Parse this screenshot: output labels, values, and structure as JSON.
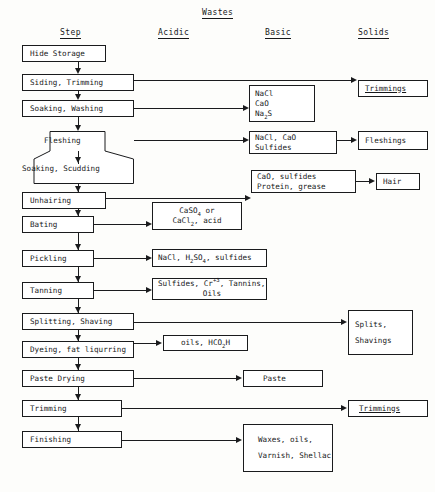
{
  "diagram": {
    "supertitle": "Wastes",
    "columns": [
      {
        "id": "step",
        "label": "Step"
      },
      {
        "id": "acidic",
        "label": "Acidic"
      },
      {
        "id": "basic",
        "label": "Basic"
      },
      {
        "id": "solids",
        "label": "Solids"
      }
    ]
  },
  "steps": [
    {
      "id": "hide-storage",
      "label": "Hide Storage"
    },
    {
      "id": "siding-trimming",
      "label": "Siding, Trimming"
    },
    {
      "id": "soaking-washing",
      "label": "Soaking, Washing"
    },
    {
      "id": "fleshing",
      "label": "Fleshing"
    },
    {
      "id": "soaking-scudding",
      "label": "Soaking, Scudding"
    },
    {
      "id": "unhairing",
      "label": "Unhairing"
    },
    {
      "id": "bating",
      "label": "Bating"
    },
    {
      "id": "pickling",
      "label": "Pickling"
    },
    {
      "id": "tanning",
      "label": "Tanning"
    },
    {
      "id": "splitting-shaving",
      "label": "Splitting, Shaving"
    },
    {
      "id": "dyeing-fat-liqurring",
      "label": "Dyeing, fat liqurring"
    },
    {
      "id": "paste-drying",
      "label": "Paste Drying"
    },
    {
      "id": "trimming",
      "label": "Trimming"
    },
    {
      "id": "finishing",
      "label": "Finishing"
    }
  ],
  "wastes": {
    "acidic": {
      "bating": {
        "line1": "CaSO",
        "sub1": "4",
        "line1b": " or",
        "line2": "CaCl",
        "sub2": "2",
        "line2b": ", acid"
      },
      "pickling": {
        "line1": "NaCl, H",
        "sub1": "2",
        "line1b": "SO",
        "sub2": "4",
        "line1c": ", sulfides"
      },
      "tanning": {
        "line1": "Sulfides, Cr",
        "sup1": "+3",
        "line1b": ", Tannins,",
        "line2": "Oils"
      },
      "dyeing": {
        "line1": "oils, HCO",
        "sub1": "2",
        "line1b": "H"
      }
    },
    "basic": {
      "soaking_washing": {
        "line1": "NaCl",
        "line2": "CaO",
        "line3": "Na",
        "sub3": "2",
        "line3b": "S"
      },
      "fleshing": {
        "line1": "NaCl, CaO",
        "line2": "Sulfides"
      },
      "unhairing": {
        "line1": "CaO, sulfides",
        "line2": "Protein, grease"
      },
      "paste_drying": {
        "line1": "Paste"
      },
      "finishing": {
        "line1": "Waxes, oils,",
        "line2": "Varnish, Shellac"
      }
    },
    "solids": {
      "siding_trimming": {
        "label": "Trimmings"
      },
      "fleshing": {
        "label": "Fleshings"
      },
      "unhairing": {
        "label": "Hair"
      },
      "splitting_shaving": {
        "line1": "Splits,",
        "line2": "Shavings"
      },
      "trimming": {
        "label": "Trimmings"
      }
    }
  }
}
